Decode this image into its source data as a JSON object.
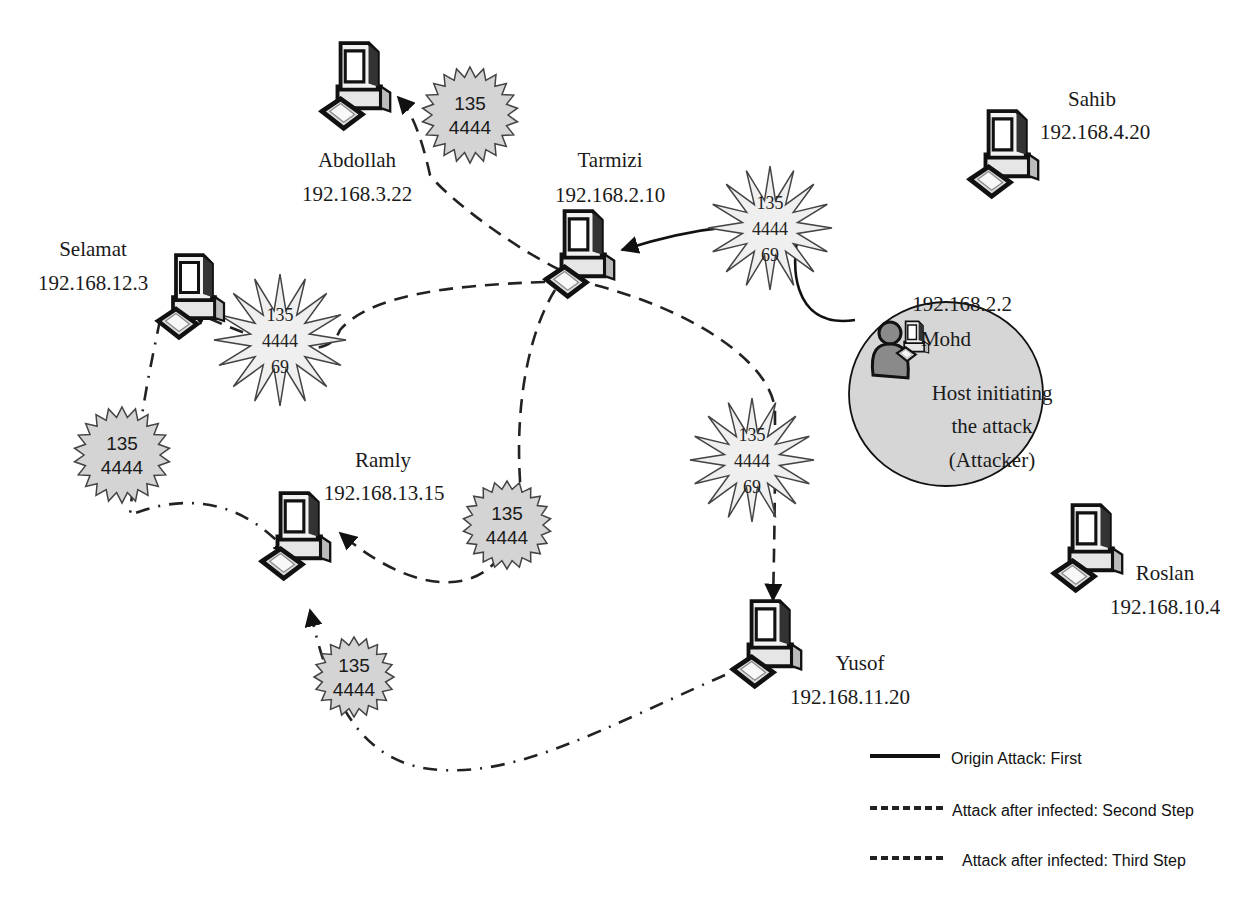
{
  "hosts": [
    {
      "id": "abdollah",
      "name": "Abdollah",
      "ip": "192.168.3.22"
    },
    {
      "id": "tarmizi",
      "name": "Tarmizi",
      "ip": "192.168.2.10"
    },
    {
      "id": "sahib",
      "name": "Sahib",
      "ip": "192.168.4.20"
    },
    {
      "id": "selamat",
      "name": "Selamat",
      "ip": "192.168.12.3"
    },
    {
      "id": "ramly",
      "name": "Ramly",
      "ip": "192.168.13.15"
    },
    {
      "id": "yusof",
      "name": "Yusof",
      "ip": "192.168.11.20"
    },
    {
      "id": "roslan",
      "name": "Roslan",
      "ip": "192.168.10.4"
    }
  ],
  "attacker": {
    "name": "Mohd",
    "ip": "192.168.2.2",
    "caption_lines": [
      "Host initiating",
      "the attack",
      "(Attacker)"
    ]
  },
  "bursts": [
    {
      "id": "b-tarmizi",
      "lines": [
        "135",
        "4444",
        "69"
      ]
    },
    {
      "id": "b-abdollah",
      "lines": [
        "135",
        "4444"
      ]
    },
    {
      "id": "b-selamat",
      "lines": [
        "135",
        "4444",
        "69"
      ]
    },
    {
      "id": "b-yusof",
      "lines": [
        "135",
        "4444",
        "69"
      ]
    },
    {
      "id": "b-ramly-from-tarmizi",
      "lines": [
        "135",
        "4444"
      ]
    },
    {
      "id": "b-ramly-from-selamat",
      "lines": [
        "135",
        "4444"
      ]
    },
    {
      "id": "b-ramly-from-yusof",
      "lines": [
        "135",
        "4444"
      ]
    }
  ],
  "legend": [
    {
      "style": "solid",
      "label": "Origin Attack: First"
    },
    {
      "style": "dashed",
      "label": "Attack after infected: Second Step"
    },
    {
      "style": "dotted",
      "label": "Attack after infected: Third Step"
    }
  ],
  "colors": {
    "burst_fill": "#d4d4d4",
    "burst_fill_light": "#efefef",
    "attacker_circle": "#d6d6d6",
    "line": "#222222"
  }
}
